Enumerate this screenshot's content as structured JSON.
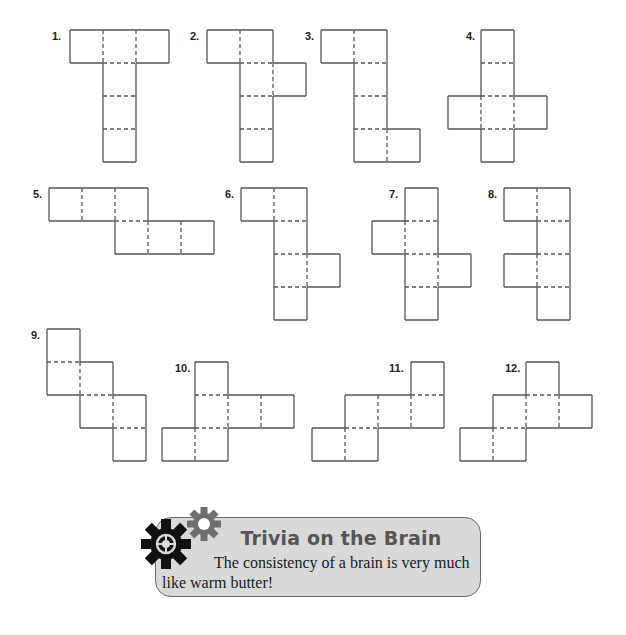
{
  "page": {
    "background": "#ffffff",
    "line_color": "#555555"
  },
  "puzzle": {
    "cell_size": 33,
    "nets": [
      {
        "label": "1.",
        "label_pos": [
          52,
          30
        ],
        "origin": [
          70,
          30
        ],
        "cells": [
          [
            0,
            0
          ],
          [
            1,
            0
          ],
          [
            2,
            0
          ],
          [
            1,
            1
          ],
          [
            1,
            2
          ],
          [
            1,
            3
          ]
        ]
      },
      {
        "label": "2.",
        "label_pos": [
          190,
          30
        ],
        "origin": [
          207,
          30
        ],
        "cells": [
          [
            0,
            0
          ],
          [
            1,
            0
          ],
          [
            1,
            1
          ],
          [
            2,
            1
          ],
          [
            1,
            2
          ],
          [
            1,
            3
          ]
        ]
      },
      {
        "label": "3.",
        "label_pos": [
          305,
          30
        ],
        "origin": [
          321,
          30
        ],
        "cells": [
          [
            0,
            0
          ],
          [
            1,
            0
          ],
          [
            1,
            1
          ],
          [
            1,
            2
          ],
          [
            1,
            3
          ],
          [
            2,
            3
          ]
        ]
      },
      {
        "label": "4.",
        "label_pos": [
          466,
          30
        ],
        "origin": [
          448,
          30
        ],
        "cells": [
          [
            1,
            0
          ],
          [
            1,
            1
          ],
          [
            0,
            2
          ],
          [
            1,
            2
          ],
          [
            2,
            2
          ],
          [
            1,
            3
          ]
        ]
      },
      {
        "label": "5.",
        "label_pos": [
          33,
          188
        ],
        "origin": [
          49,
          188
        ],
        "cells": [
          [
            0,
            0
          ],
          [
            1,
            0
          ],
          [
            2,
            0
          ],
          [
            2,
            1
          ],
          [
            3,
            1
          ],
          [
            4,
            1
          ]
        ]
      },
      {
        "label": "6.",
        "label_pos": [
          225,
          188
        ],
        "origin": [
          241,
          188
        ],
        "cells": [
          [
            0,
            0
          ],
          [
            1,
            0
          ],
          [
            1,
            1
          ],
          [
            1,
            2
          ],
          [
            2,
            2
          ],
          [
            1,
            3
          ]
        ]
      },
      {
        "label": "7.",
        "label_pos": [
          389,
          188
        ],
        "origin": [
          372,
          188
        ],
        "cells": [
          [
            1,
            0
          ],
          [
            0,
            1
          ],
          [
            1,
            1
          ],
          [
            1,
            2
          ],
          [
            2,
            2
          ],
          [
            1,
            3
          ]
        ]
      },
      {
        "label": "8.",
        "label_pos": [
          488,
          188
        ],
        "origin": [
          504,
          188
        ],
        "cells": [
          [
            0,
            0
          ],
          [
            1,
            0
          ],
          [
            1,
            1
          ],
          [
            0,
            2
          ],
          [
            1,
            2
          ],
          [
            1,
            3
          ]
        ]
      },
      {
        "label": "9.",
        "label_pos": [
          31,
          329
        ],
        "origin": [
          47,
          329
        ],
        "cells": [
          [
            0,
            0
          ],
          [
            0,
            1
          ],
          [
            1,
            1
          ],
          [
            1,
            2
          ],
          [
            2,
            2
          ],
          [
            2,
            3
          ]
        ]
      },
      {
        "label": "10.",
        "label_pos": [
          175,
          362
        ],
        "origin": [
          162,
          362
        ],
        "cells": [
          [
            1,
            0
          ],
          [
            1,
            1
          ],
          [
            2,
            1
          ],
          [
            3,
            1
          ],
          [
            0,
            2
          ],
          [
            1,
            2
          ]
        ]
      },
      {
        "label": "11.",
        "label_pos": [
          389,
          362
        ],
        "origin": [
          312,
          362
        ],
        "cells": [
          [
            3,
            0
          ],
          [
            1,
            1
          ],
          [
            2,
            1
          ],
          [
            3,
            1
          ],
          [
            0,
            2
          ],
          [
            1,
            2
          ]
        ]
      },
      {
        "label": "12.",
        "label_pos": [
          505,
          362
        ],
        "origin": [
          460,
          362
        ],
        "cells": [
          [
            2,
            0
          ],
          [
            1,
            1
          ],
          [
            2,
            1
          ],
          [
            3,
            1
          ],
          [
            0,
            2
          ],
          [
            1,
            2
          ]
        ]
      }
    ]
  },
  "trivia": {
    "title": "Trivia on the Brain",
    "text": "The consistency of a brain is very much like warm butter!",
    "box_color": "#d9d9d9",
    "title_color": "#555555",
    "icons": [
      "gear-black-icon",
      "gear-gray-icon"
    ]
  }
}
